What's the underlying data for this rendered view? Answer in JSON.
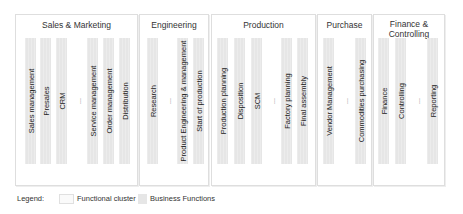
{
  "clusters": [
    {
      "title": "Sales & Marketing",
      "functions": [
        "Sales management",
        "Presales",
        "CRM",
        "...",
        "Service management",
        "Order management",
        "Distribution"
      ]
    },
    {
      "title": "Engineering",
      "functions": [
        "Research",
        "...",
        "Product Engineering & management",
        "Start of production"
      ]
    },
    {
      "title": "Production",
      "functions": [
        "Production planning",
        "Disposition",
        "SCM",
        "...",
        "Factory planning",
        "Final assembly"
      ]
    },
    {
      "title": "Purchase",
      "functions": [
        "Vendor Management",
        "...",
        "Commodities purchasing"
      ]
    },
    {
      "title_line1": "Finance &",
      "title_line2": "Controlling",
      "functions": [
        "Finance",
        "Controlling",
        "...",
        "Reporting"
      ]
    }
  ],
  "legend": {
    "label": "Legend:",
    "functional_cluster": "Functional cluster",
    "business_functions": "Business Functions"
  },
  "colors": {
    "cluster_border": "#dedede",
    "business_function_fill": "#e6e6e6"
  }
}
